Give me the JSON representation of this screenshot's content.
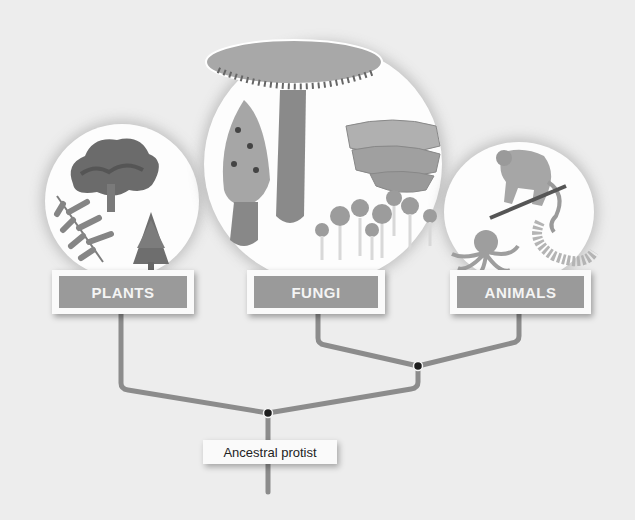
{
  "diagram": {
    "type": "phylogenetic-tree",
    "root": {
      "label": "Ancestral protist"
    },
    "groups": [
      {
        "id": "plants",
        "label": "PLANTS",
        "illustrations": [
          "tree",
          "fern",
          "conifer"
        ]
      },
      {
        "id": "fungi",
        "label": "FUNGI",
        "illustrations": [
          "gilled-mushroom",
          "morel",
          "bracket-fungus",
          "slime-mold-fruiting-bodies"
        ]
      },
      {
        "id": "animals",
        "label": "ANIMALS",
        "illustrations": [
          "monkey-on-branch",
          "octopus",
          "segmented-worm"
        ]
      }
    ],
    "branching": [
      {
        "node": "fungi-animals",
        "children": [
          "FUNGI",
          "ANIMALS"
        ]
      },
      {
        "node": "root",
        "children": [
          "PLANTS",
          "fungi-animals"
        ],
        "label": "Ancestral protist"
      }
    ],
    "colors": {
      "line": "#8c8c8c",
      "node": "#1e1e1e",
      "label_fill": "#9a9a9a",
      "label_text": "#f4f4f4",
      "background": "#ededed"
    }
  }
}
